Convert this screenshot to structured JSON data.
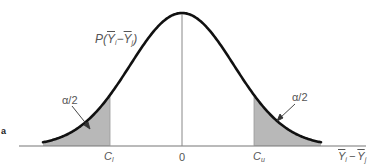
{
  "chart_data": {
    "type": "area",
    "title": "",
    "curve_label": "P(Ȳi − Ȳj)",
    "xlabel": "Ȳi − Ȳj",
    "ylabel": "",
    "tick_labels": [
      "Cl",
      "0",
      "Cu"
    ],
    "shaded_regions": [
      {
        "name": "lower tail",
        "from": "-inf",
        "to": "Cl",
        "label": "α/2"
      },
      {
        "name": "upper tail",
        "from": "Cu",
        "to": "+inf",
        "label": "α/2"
      }
    ],
    "center": 0,
    "grid": false,
    "legend": "none"
  },
  "labels": {
    "curve": {
      "prefix": "P(",
      "y1": "Y",
      "s1": "i",
      "minus": "−",
      "y2": "Y",
      "s2": "j",
      "suffix": ")"
    },
    "alpha_left": "α/2",
    "alpha_right": "α/2",
    "tick_lower": {
      "main": "C",
      "sub": "l"
    },
    "tick_zero": "0",
    "tick_upper": {
      "main": "C",
      "sub": "u"
    },
    "xaxis": {
      "y1": "Y",
      "s1": "i",
      "minus": "−",
      "y2": "Y",
      "s2": "j"
    },
    "stray_mark": "a"
  },
  "colors": {
    "curve": "#111111",
    "shade": "#b8b8b8",
    "axis": "#777777",
    "text": "#555555"
  }
}
